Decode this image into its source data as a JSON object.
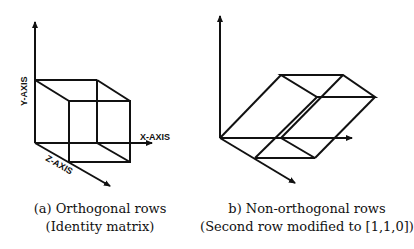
{
  "left_figure": {
    "labels": {
      "y_axis": "Y-AXIS",
      "x_axis": "X-AXIS",
      "z_axis": "Z-AXIS"
    },
    "caption_line1": "(a) Orthogonal rows",
    "caption_line2": "(Identity matrix)"
  },
  "right_figure": {
    "caption_line1": "b) Non-orthogonal rows",
    "caption_line2": "(Second row modified to [1,1,0])"
  },
  "colors": {
    "stroke": "#111111",
    "background": "#ffffff"
  }
}
